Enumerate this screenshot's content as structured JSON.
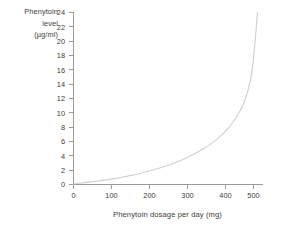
{
  "chart_data": {
    "type": "line",
    "title": "",
    "xlabel": "Phenytoin dosage per day (mg)",
    "ylabel": "Phenytoin level (µg/ml)",
    "ylabel_lines": [
      "Phenytoin",
      "level",
      "(µg/ml)"
    ],
    "xlim": [
      0,
      520
    ],
    "ylim": [
      0,
      24
    ],
    "xticks": [
      0,
      100,
      200,
      300,
      400,
      500
    ],
    "xtick_labels": [
      "0",
      "100",
      "200",
      "300",
      "400",
      "500"
    ],
    "yticks": [
      0,
      2,
      4,
      6,
      8,
      10,
      12,
      14,
      16,
      18,
      20,
      22,
      24
    ],
    "ytick_labels": [
      "0",
      "2",
      "4",
      "6",
      "8",
      "10",
      "12",
      "14",
      "16",
      "18",
      "20",
      "22",
      "24"
    ],
    "grid": false,
    "legend": "none",
    "series": [
      {
        "name": "Phenytoin level",
        "color": "#cfcfcf",
        "x": [
          0,
          25,
          50,
          75,
          100,
          125,
          150,
          175,
          200,
          225,
          250,
          275,
          300,
          325,
          350,
          375,
          400,
          425,
          440,
          455,
          465,
          475,
          482,
          488,
          493,
          497,
          500,
          503,
          505
        ],
        "y": [
          0.0,
          0.15,
          0.3,
          0.45,
          0.65,
          0.85,
          1.1,
          1.35,
          1.7,
          2.05,
          2.45,
          2.9,
          3.4,
          4.0,
          4.7,
          5.5,
          6.5,
          7.8,
          8.8,
          10.0,
          11.0,
          12.4,
          13.7,
          15.2,
          17.0,
          19.2,
          20.8,
          22.8,
          24.0
        ]
      }
    ]
  },
  "axes_geometry": {
    "left_px": 73,
    "right_px": 263,
    "top_px": 12,
    "bottom_px": 184,
    "x_per_unit": 0.38,
    "y_per_unit": 7.1667
  }
}
